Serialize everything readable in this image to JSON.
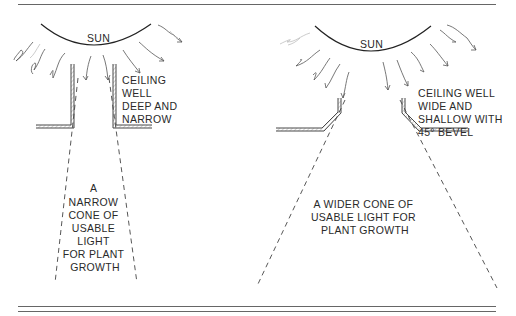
{
  "left_panel": {
    "sun_label": "SUN",
    "well_label": [
      "CEILING",
      "WELL",
      "DEEP AND",
      "NARROW"
    ],
    "cone_label": [
      "A",
      "NARROW",
      "CONE OF",
      "USABLE",
      "LIGHT",
      "FOR PLANT",
      "GROWTH"
    ]
  },
  "right_panel": {
    "sun_label": "SUN",
    "well_label": [
      "CEILING WELL",
      "WIDE AND",
      "SHALLOW WITH",
      "45° BEVEL"
    ],
    "cone_label": [
      "A WIDER CONE OF",
      "USABLE LIGHT FOR",
      "PLANT GROWTH"
    ]
  }
}
